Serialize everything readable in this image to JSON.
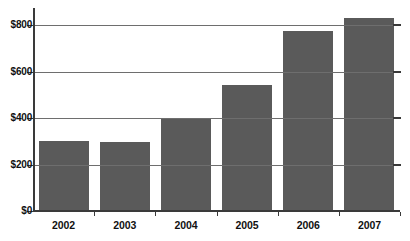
{
  "chart_data": {
    "type": "bar",
    "title": "",
    "xlabel": "",
    "ylabel": "",
    "categories": [
      "2002",
      "2003",
      "2004",
      "2005",
      "2006",
      "2007"
    ],
    "values": [
      300,
      295,
      395,
      540,
      775,
      830
    ],
    "ylim": [
      0,
      900
    ],
    "yticks": [
      0,
      200,
      400,
      600,
      800
    ],
    "ytick_labels": [
      "$0",
      "$200",
      "$400",
      "$600",
      "$800"
    ],
    "grid": true,
    "legend": "none",
    "series": [
      {
        "name": "",
        "values": [
          300,
          295,
          395,
          540,
          775,
          830
        ]
      }
    ],
    "bar_color": "#5a5a5a",
    "axis_color": "#3a3a3a",
    "gridline_color": "#6e6e6e",
    "background_color": "#ffffff"
  }
}
